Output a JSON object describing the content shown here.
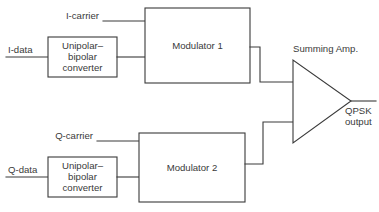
{
  "diagram": {
    "colors": {
      "background": "#ffffff",
      "stroke": "#3a3a3a",
      "text": "#3a3a3a"
    },
    "blocks": [
      {
        "id": "i-converter",
        "lines": [
          "Unipolar–",
          "bipolar",
          "converter"
        ]
      },
      {
        "id": "modulator-1",
        "lines": [
          "Modulator 1"
        ]
      },
      {
        "id": "q-converter",
        "lines": [
          "Unipolar–",
          "bipolar",
          "converter"
        ]
      },
      {
        "id": "modulator-2",
        "lines": [
          "Modulator 2"
        ]
      }
    ],
    "labels": {
      "i_carrier": "I-carrier",
      "i_data": "I-data",
      "q_carrier": "Q-carrier",
      "q_data": "Q-data",
      "summing_amp": "Summing Amp.",
      "output_line_1": "QPSK",
      "output_line_2": "output"
    },
    "amplifier": {
      "id": "summing-amplifier",
      "shape": "triangle"
    }
  }
}
